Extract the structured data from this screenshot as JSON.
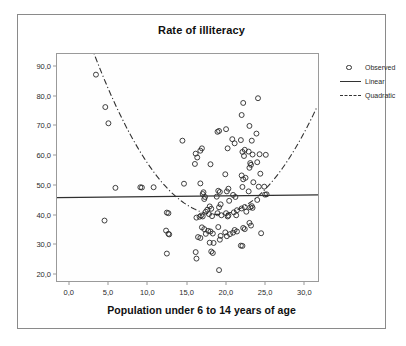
{
  "chart_data": {
    "type": "scatter",
    "title": "Rate of illiteracy",
    "xlabel": "Population under 6 to 14 years of age",
    "ylabel": "",
    "xlim": [
      -1.5,
      32.0
    ],
    "ylim": [
      17.0,
      94.0
    ],
    "grid": false,
    "xticks": [
      "0,0",
      "5,0",
      "10,0",
      "15,0",
      "20,0",
      "25,0",
      "30,0"
    ],
    "xtick_values": [
      0,
      5,
      10,
      15,
      20,
      25,
      30
    ],
    "yticks": [
      "20,0",
      "30,0",
      "40,0",
      "50,0",
      "60,0",
      "70,0",
      "80,0",
      "90,0"
    ],
    "ytick_values": [
      20,
      30,
      40,
      50,
      60,
      70,
      80,
      90
    ],
    "legend_position": "right-outside",
    "legend": [
      {
        "label": "Observed",
        "marker": "open-circle"
      },
      {
        "label": "Linear",
        "marker": "solid-line"
      },
      {
        "label": "Quadratic",
        "marker": "dash-dot-line"
      }
    ],
    "series": [
      {
        "name": "Observed",
        "marker": "open-circle",
        "color": "#2a2a2a",
        "points": [
          [
            3.5,
            87.0
          ],
          [
            4.7,
            76.0
          ],
          [
            5.1,
            70.5
          ],
          [
            6.0,
            48.6
          ],
          [
            4.6,
            37.5
          ],
          [
            9.2,
            48.8
          ],
          [
            9.4,
            48.7
          ],
          [
            10.9,
            48.8
          ],
          [
            12.6,
            40.2
          ],
          [
            12.8,
            40.0
          ],
          [
            12.5,
            34.1
          ],
          [
            12.8,
            33.0
          ],
          [
            12.9,
            32.8
          ],
          [
            12.6,
            26.3
          ],
          [
            14.6,
            64.6
          ],
          [
            14.8,
            50.0
          ],
          [
            16.3,
            60.2
          ],
          [
            16.5,
            58.9
          ],
          [
            16.2,
            56.7
          ],
          [
            16.9,
            61.2
          ],
          [
            17.1,
            62.0
          ],
          [
            16.9,
            50.1
          ],
          [
            16.4,
            38.5
          ],
          [
            16.8,
            38.8
          ],
          [
            17.0,
            39.2
          ],
          [
            17.2,
            38.9
          ],
          [
            16.6,
            31.9
          ],
          [
            16.9,
            31.6
          ],
          [
            16.3,
            26.8
          ],
          [
            16.4,
            24.6
          ],
          [
            17.2,
            46.5
          ],
          [
            17.3,
            47.1
          ],
          [
            17.5,
            45.5
          ],
          [
            17.4,
            44.8
          ],
          [
            17.6,
            40.5
          ],
          [
            17.8,
            41.2
          ],
          [
            17.1,
            35.2
          ],
          [
            17.4,
            34.6
          ],
          [
            17.9,
            34.0
          ],
          [
            17.6,
            33.0
          ],
          [
            18.2,
            56.6
          ],
          [
            18.1,
            42.3
          ],
          [
            18.3,
            41.5
          ],
          [
            18.0,
            39.7
          ],
          [
            18.4,
            39.0
          ],
          [
            18.2,
            33.8
          ],
          [
            18.5,
            33.1
          ],
          [
            18.1,
            30.0
          ],
          [
            18.6,
            29.9
          ],
          [
            18.3,
            27.0
          ],
          [
            18.5,
            26.5
          ],
          [
            19.1,
            67.6
          ],
          [
            19.3,
            67.9
          ],
          [
            19.2,
            47.6
          ],
          [
            19.4,
            47.2
          ],
          [
            19.0,
            45.6
          ],
          [
            19.5,
            43.0
          ],
          [
            19.3,
            42.0
          ],
          [
            19.1,
            40.0
          ],
          [
            19.6,
            39.3
          ],
          [
            19.2,
            35.3
          ],
          [
            19.5,
            32.3
          ],
          [
            19.4,
            31.0
          ],
          [
            19.3,
            20.7
          ],
          [
            20.2,
            68.5
          ],
          [
            20.4,
            62.0
          ],
          [
            20.1,
            53.2
          ],
          [
            20.5,
            48.3
          ],
          [
            20.3,
            47.4
          ],
          [
            20.6,
            44.2
          ],
          [
            20.2,
            40.0
          ],
          [
            20.5,
            39.2
          ],
          [
            20.4,
            38.9
          ],
          [
            20.1,
            33.5
          ],
          [
            20.7,
            32.9
          ],
          [
            20.3,
            32.2
          ],
          [
            21.0,
            65.1
          ],
          [
            21.3,
            63.7
          ],
          [
            21.1,
            46.2
          ],
          [
            21.4,
            45.5
          ],
          [
            21.6,
            41.0
          ],
          [
            21.2,
            40.3
          ],
          [
            21.5,
            39.3
          ],
          [
            21.3,
            34.3
          ],
          [
            21.6,
            33.8
          ],
          [
            21.1,
            33.4
          ],
          [
            22.2,
            73.3
          ],
          [
            22.4,
            77.4
          ],
          [
            22.1,
            64.8
          ],
          [
            22.6,
            61.5
          ],
          [
            22.3,
            60.8
          ],
          [
            22.5,
            59.4
          ],
          [
            22.2,
            52.8
          ],
          [
            22.7,
            52.0
          ],
          [
            22.4,
            51.5
          ],
          [
            22.3,
            48.9
          ],
          [
            22.6,
            42.1
          ],
          [
            22.2,
            41.6
          ],
          [
            22.8,
            40.5
          ],
          [
            22.4,
            35.0
          ],
          [
            22.6,
            34.6
          ],
          [
            22.1,
            29.0
          ],
          [
            22.3,
            28.9
          ],
          [
            23.2,
            69.6
          ],
          [
            23.5,
            64.6
          ],
          [
            23.1,
            60.9
          ],
          [
            23.6,
            59.9
          ],
          [
            23.3,
            57.0
          ],
          [
            23.4,
            56.4
          ],
          [
            23.2,
            55.4
          ],
          [
            23.7,
            50.5
          ],
          [
            23.1,
            47.4
          ],
          [
            23.5,
            42.4
          ],
          [
            23.3,
            42.0
          ],
          [
            23.6,
            41.8
          ],
          [
            23.2,
            36.7
          ],
          [
            23.4,
            35.8
          ],
          [
            24.3,
            79.0
          ],
          [
            24.1,
            67.0
          ],
          [
            24.5,
            60.0
          ],
          [
            24.2,
            57.3
          ],
          [
            24.6,
            53.4
          ],
          [
            24.4,
            49.0
          ],
          [
            24.2,
            44.5
          ],
          [
            24.7,
            33.2
          ],
          [
            25.3,
            59.8
          ],
          [
            25.1,
            49.0
          ],
          [
            25.4,
            46.4
          ],
          [
            25.2,
            46.3
          ]
        ]
      },
      {
        "name": "Linear",
        "type": "fit-line",
        "style": "solid",
        "color": "#303030",
        "endpoints": [
          [
            -1.5,
            45.3
          ],
          [
            32.0,
            46.2
          ]
        ]
      },
      {
        "name": "Quadratic",
        "type": "fit-curve",
        "style": "dash-dot",
        "color": "#303030",
        "vertex": [
          19.0,
          39.6
        ],
        "curvature": 0.22,
        "x_range": [
          -1.3,
          31.8
        ]
      }
    ]
  }
}
